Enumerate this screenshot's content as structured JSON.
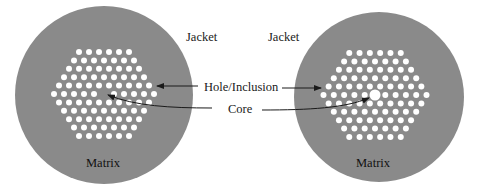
{
  "colors": {
    "background": "#ffffff",
    "matrix": "#8a8a8a",
    "hole": "#ffffff",
    "arrow": "#1a1a1a",
    "text": "#1a1a1a"
  },
  "labels": {
    "jacket_left": "Jacket",
    "jacket_right": "Jacket",
    "hole_inclusion": "Hole/Inclusion",
    "core": "Core",
    "matrix_left": "Matrix",
    "matrix_right": "Matrix"
  },
  "fibers": [
    {
      "name": "left-fiber",
      "core_type": "solid (missing central hole)",
      "center": [
        104,
        95
      ],
      "radius": 89,
      "lattice": {
        "rows": [
          6,
          7,
          8,
          9,
          10,
          11,
          10,
          9,
          8,
          7,
          6
        ],
        "pitch_x": 10,
        "pitch_y": 8.4,
        "hole_radius": 3,
        "center": [
          104,
          94
        ]
      }
    },
    {
      "name": "right-fiber",
      "core_type": "enlarged central hole",
      "center": [
        379,
        97
      ],
      "radius": 85,
      "lattice": {
        "rows": [
          6,
          7,
          8,
          9,
          10,
          11,
          10,
          9,
          8,
          7,
          6
        ],
        "pitch_x": 10.3,
        "pitch_y": 8.4,
        "hole_radius": 3,
        "center": [
          375,
          95
        ],
        "core_radius": 5.5
      }
    }
  ]
}
